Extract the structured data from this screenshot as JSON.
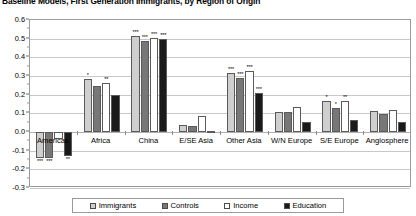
{
  "chart_data": {
    "type": "bar",
    "title": "Baseline Models, First Generation Immigrants, by Region of Origin",
    "xlabel": "",
    "ylabel": "",
    "ylim": [
      -0.3,
      0.6
    ],
    "ytick_step": 0.1,
    "grid": true,
    "legend_position": "bottom",
    "yticks": [
      "0.6",
      "0.5",
      "0.4",
      "0.3",
      "0.2",
      "0.1",
      "0.0",
      "-0.1",
      "-0.2",
      "-0.3"
    ],
    "ytick_values": [
      0.6,
      0.5,
      0.4,
      0.3,
      0.2,
      0.1,
      0.0,
      -0.1,
      -0.2,
      -0.3
    ],
    "categories": [
      "Americas",
      "Africa",
      "China",
      "E/SE Asia",
      "Other Asia",
      "W/N Europe",
      "S/E Europe",
      "Anglosphere"
    ],
    "series": [
      {
        "name": "Immigrants",
        "color": "#cfcfcf",
        "values": [
          -0.14,
          0.285,
          0.515,
          0.035,
          0.315,
          0.105,
          0.165,
          0.115
        ],
        "significance": [
          "***",
          "*",
          "***",
          "",
          "***",
          "",
          "*",
          ""
        ]
      },
      {
        "name": "Controls",
        "color": "#777777",
        "values": [
          -0.14,
          0.245,
          0.49,
          0.03,
          0.29,
          0.105,
          0.13,
          0.095
        ],
        "significance": [
          "***",
          "",
          "***",
          "",
          "***",
          "",
          "*",
          ""
        ]
      },
      {
        "name": "Income",
        "color": "#ffffff",
        "values": [
          -0.04,
          0.265,
          0.505,
          0.085,
          0.325,
          0.135,
          0.165,
          0.12
        ],
        "significance": [
          "",
          "**",
          "***",
          "",
          "***",
          "",
          "**",
          ""
        ]
      },
      {
        "name": "Education",
        "color": "#1a1a1a",
        "values": [
          -0.13,
          0.2,
          0.5,
          0.005,
          0.21,
          0.055,
          0.065,
          0.055
        ],
        "significance": [
          "**",
          "",
          "***",
          "",
          "***",
          "",
          "",
          ""
        ]
      }
    ]
  },
  "legend": {
    "items": [
      {
        "label": "Immigrants",
        "color": "#cfcfcf"
      },
      {
        "label": "Controls",
        "color": "#777777"
      },
      {
        "label": "Income",
        "color": "#ffffff"
      },
      {
        "label": "Education",
        "color": "#1a1a1a"
      }
    ]
  }
}
